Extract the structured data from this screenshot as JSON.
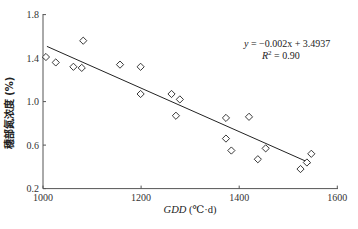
{
  "chart_data": {
    "type": "scatter",
    "title": "",
    "xlabel": "GDD (℃·d)",
    "xlabel_italic_part": "GDD",
    "xlabel_unit": " (℃·d)",
    "ylabel": "穗部氮浓度 (%)",
    "xlim": [
      1000,
      1600
    ],
    "ylim": [
      0.2,
      1.8
    ],
    "xticks": [
      1000,
      1200,
      1400,
      1600
    ],
    "xtick_labels": [
      "1000",
      "1200",
      "1400",
      "1600"
    ],
    "yticks": [
      0.2,
      0.6,
      1.0,
      1.4,
      1.8
    ],
    "ytick_labels": [
      "0.2",
      "0.6",
      "1.0",
      "1.4",
      "1.8"
    ],
    "grid": false,
    "marker": "diamond-open",
    "series": [
      {
        "name": "observed",
        "points": [
          {
            "x": 1006,
            "y": 1.41
          },
          {
            "x": 1026,
            "y": 1.36
          },
          {
            "x": 1062,
            "y": 1.32
          },
          {
            "x": 1079,
            "y": 1.31
          },
          {
            "x": 1082,
            "y": 1.56
          },
          {
            "x": 1157,
            "y": 1.34
          },
          {
            "x": 1199,
            "y": 1.32
          },
          {
            "x": 1199,
            "y": 1.07
          },
          {
            "x": 1262,
            "y": 1.07
          },
          {
            "x": 1279,
            "y": 1.02
          },
          {
            "x": 1271,
            "y": 0.87
          },
          {
            "x": 1373,
            "y": 0.85
          },
          {
            "x": 1420,
            "y": 0.86
          },
          {
            "x": 1373,
            "y": 0.66
          },
          {
            "x": 1384,
            "y": 0.55
          },
          {
            "x": 1454,
            "y": 0.57
          },
          {
            "x": 1438,
            "y": 0.47
          },
          {
            "x": 1525,
            "y": 0.38
          },
          {
            "x": 1538,
            "y": 0.44
          },
          {
            "x": 1547,
            "y": 0.52
          }
        ]
      }
    ],
    "regression": {
      "slope": -0.002,
      "intercept": 3.4937,
      "x_range": [
        1008,
        1545
      ],
      "equation_text": "y = −0.002x + 3.4937",
      "r2_text": "R² = 0.90"
    },
    "annotations": [
      {
        "text": "y = −0.002x + 3.4937",
        "position": "upper-right"
      },
      {
        "text": "R² = 0.90",
        "position": "upper-right"
      }
    ]
  }
}
